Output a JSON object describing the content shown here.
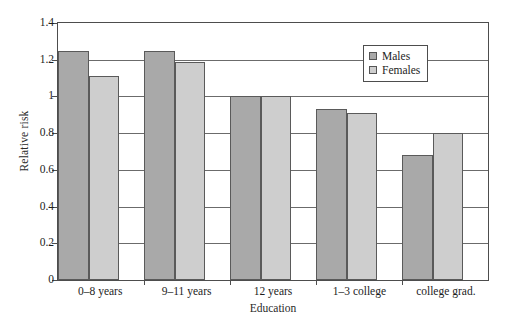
{
  "chart_data": {
    "type": "bar",
    "title": "",
    "xlabel": "Education",
    "ylabel": "Relative risk",
    "categories": [
      "0–8 years",
      "9–11 years",
      "12 years",
      "1–3 college",
      "college grad."
    ],
    "series": [
      {
        "name": "Males",
        "color": "#a9a9a9",
        "values": [
          1.25,
          1.25,
          1.0,
          0.93,
          0.68
        ]
      },
      {
        "name": "Females",
        "color": "#cecece",
        "values": [
          1.11,
          1.19,
          1.0,
          0.91,
          0.8
        ]
      }
    ],
    "ylim": [
      0,
      1.4
    ],
    "ytick_labels": [
      "0",
      "0.2",
      "0.4",
      "0.6",
      "0.8",
      "1",
      "1.2",
      "1.4"
    ],
    "ytick_values": [
      0,
      0.2,
      0.4,
      0.6,
      0.8,
      1.0,
      1.2,
      1.4
    ],
    "grid": true,
    "grid_axis": "y",
    "legend_position": "top-right",
    "legend_entries": [
      "Males",
      "Females"
    ]
  }
}
